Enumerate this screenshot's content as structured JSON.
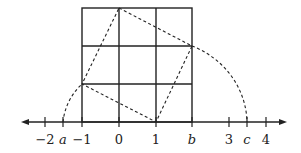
{
  "diagram": {
    "type": "number-line-with-grid",
    "axis": {
      "ticks": [
        {
          "label": "−2",
          "value": -2,
          "x": 45,
          "italic": false
        },
        {
          "label": "a",
          "value": "a",
          "x": 63,
          "italic": true
        },
        {
          "label": "−1",
          "value": -1,
          "x": 82,
          "italic": false
        },
        {
          "label": "0",
          "value": 0,
          "x": 119,
          "italic": false
        },
        {
          "label": "1",
          "value": 1,
          "x": 156,
          "italic": false
        },
        {
          "label": "b",
          "value": "b",
          "x": 192,
          "italic": true
        },
        {
          "label": "3",
          "value": 3,
          "x": 229,
          "italic": false
        },
        {
          "label": "c",
          "value": "c",
          "x": 247,
          "italic": true
        },
        {
          "label": "4",
          "value": 4,
          "x": 266,
          "italic": false
        }
      ],
      "arrows": "both"
    },
    "grid": {
      "cols": 3,
      "rows": 3,
      "from_x": -1,
      "to_x": 2
    },
    "tilted_square_vertices": [
      [
        0,
        3
      ],
      [
        2,
        2
      ],
      [
        1,
        0
      ],
      [
        -1,
        1
      ]
    ]
  }
}
